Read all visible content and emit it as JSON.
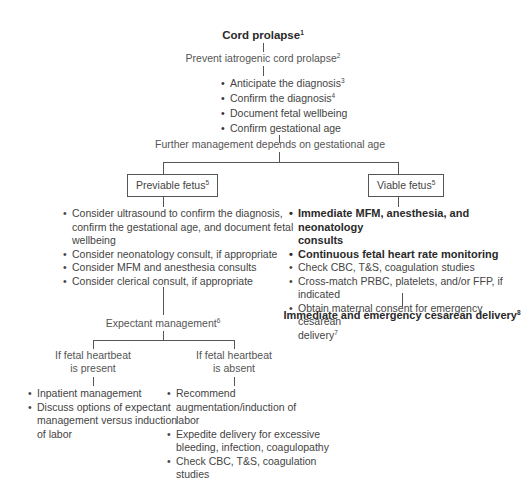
{
  "root": {
    "title": "Cord prolapse",
    "ref": "1"
  },
  "prevent": {
    "text": "Prevent iatrogenic cord prolapse",
    "ref": "2"
  },
  "initial_steps": [
    {
      "text": "Anticipate the diagnosis",
      "ref": "3"
    },
    {
      "text": "Confirm the diagnosis",
      "ref": "4"
    },
    {
      "text": "Document fetal wellbeing",
      "ref": ""
    },
    {
      "text": "Confirm gestational age",
      "ref": ""
    }
  ],
  "further": {
    "text": "Further management depends on gestational age"
  },
  "previable": {
    "label": "Previable fetus",
    "ref": "5",
    "items": [
      "Consider ultrasound to confirm the diagnosis,",
      "confirm the gestational age, and document fetal",
      "wellbeing",
      "Consider neonatology consult, if appropriate",
      "Consider MFM and anesthesia consults",
      "Consider clerical consult, if appropriate"
    ],
    "expectant": {
      "text": "Expectant management",
      "ref": "6"
    },
    "present": {
      "line1": "If fetal heartbeat",
      "line2": "is present",
      "items": [
        "Inpatient management",
        "Discuss options of expectant",
        "management versus induction",
        "of labor"
      ]
    },
    "absent": {
      "line1": "If fetal heartbeat",
      "line2": "is absent",
      "items": [
        "Recommend",
        "augmentation/induction of",
        "labor",
        "Expedite delivery for excessive",
        "bleeding, infection, coagulopathy",
        "Check CBC, T&S, coagulation",
        "studies"
      ]
    }
  },
  "viable": {
    "label": "Viable fetus",
    "ref": "5",
    "items": [
      "Immediate MFM, anesthesia, and neonatology",
      "consults",
      "Continuous fetal heart rate monitoring",
      "Check CBC, T&S, coagulation studies",
      "Cross-match PRBC, platelets, and/or FFP, if indicated",
      "Obtain maternal consent for emergency cesarean",
      "delivery"
    ],
    "consent_ref": "7",
    "final": {
      "text": "Immediate and emergency cesarean delivery",
      "ref": "8"
    }
  }
}
